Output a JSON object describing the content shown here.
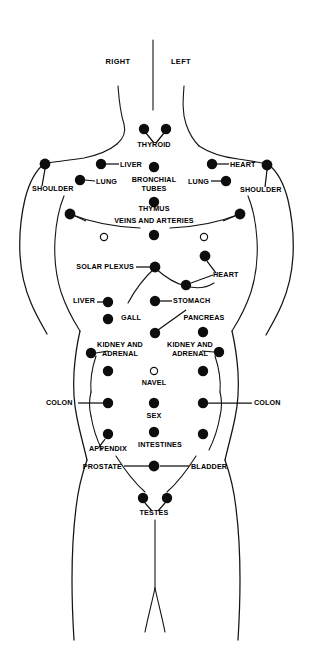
{
  "figure": {
    "title": "",
    "orientation_labels": [
      {
        "id": "right",
        "text": "RIGHT",
        "x": 118,
        "y": 64
      },
      {
        "id": "left",
        "text": "LEFT",
        "x": 181,
        "y": 64
      }
    ],
    "colors": {
      "background": "#ffffff",
      "outline": "#141414",
      "point_fill": "#0d0d0d",
      "open_point_fill": "#ffffff",
      "label_text": "#000000"
    },
    "labels": [
      {
        "id": "thyroid",
        "text": "THYROID",
        "x": 154,
        "y": 147,
        "anchor": "middle"
      },
      {
        "id": "liver-upper",
        "text": "LIVER",
        "x": 120,
        "y": 167,
        "anchor": "start"
      },
      {
        "id": "lung-left",
        "text": "LUNG",
        "x": 96,
        "y": 184,
        "anchor": "start"
      },
      {
        "id": "bronchial-tubes-1",
        "text": "BRONCHIAL",
        "x": 154,
        "y": 182,
        "anchor": "middle"
      },
      {
        "id": "bronchial-tubes-2",
        "text": "TUBES",
        "x": 154,
        "y": 191,
        "anchor": "middle"
      },
      {
        "id": "heart-upper",
        "text": "HEART",
        "x": 230,
        "y": 167,
        "anchor": "start"
      },
      {
        "id": "lung-right",
        "text": "LUNG",
        "x": 209,
        "y": 184,
        "anchor": "end"
      },
      {
        "id": "shoulder-left",
        "text": "SHOULDER",
        "x": 32,
        "y": 191,
        "anchor": "start"
      },
      {
        "id": "shoulder-right",
        "text": "SHOULDER",
        "x": 240,
        "y": 192,
        "anchor": "start"
      },
      {
        "id": "thymus",
        "text": "THYMUS",
        "x": 154,
        "y": 211,
        "anchor": "middle"
      },
      {
        "id": "veins-and-arteries",
        "text": "VEINS AND ARTERIES",
        "x": 154,
        "y": 223,
        "anchor": "middle"
      },
      {
        "id": "solar-plexus",
        "text": "SOLAR PLEXUS",
        "x": 134,
        "y": 269,
        "anchor": "end"
      },
      {
        "id": "heart-lower",
        "text": "HEART",
        "x": 213,
        "y": 277,
        "anchor": "start"
      },
      {
        "id": "liver-lower",
        "text": "LIVER",
        "x": 95,
        "y": 303,
        "anchor": "end"
      },
      {
        "id": "stomach",
        "text": "STOMACH",
        "x": 173,
        "y": 303,
        "anchor": "start"
      },
      {
        "id": "gall",
        "text": "GALL",
        "x": 131,
        "y": 320,
        "anchor": "middle"
      },
      {
        "id": "pancreas",
        "text": "PANCREAS",
        "x": 204,
        "y": 320,
        "anchor": "middle"
      },
      {
        "id": "kidney-adrenal-left-1",
        "text": "KIDNEY AND",
        "x": 120,
        "y": 347,
        "anchor": "middle"
      },
      {
        "id": "kidney-adrenal-left-2",
        "text": "ADRENAL",
        "x": 120,
        "y": 356,
        "anchor": "middle"
      },
      {
        "id": "kidney-adrenal-right-1",
        "text": "KIDNEY AND",
        "x": 190,
        "y": 347,
        "anchor": "middle"
      },
      {
        "id": "kidney-adrenal-right-2",
        "text": "ADRENAL",
        "x": 190,
        "y": 356,
        "anchor": "middle"
      },
      {
        "id": "navel",
        "text": "NAVEL",
        "x": 154,
        "y": 385,
        "anchor": "middle"
      },
      {
        "id": "colon-left",
        "text": "COLON",
        "x": 46,
        "y": 405,
        "anchor": "start"
      },
      {
        "id": "colon-right",
        "text": "COLON",
        "x": 254,
        "y": 405,
        "anchor": "start"
      },
      {
        "id": "sex",
        "text": "SEX",
        "x": 154,
        "y": 418,
        "anchor": "middle"
      },
      {
        "id": "appendix",
        "text": "APPENDIX",
        "x": 108,
        "y": 451,
        "anchor": "middle"
      },
      {
        "id": "intestines",
        "text": "INTESTINES",
        "x": 160,
        "y": 447,
        "anchor": "middle"
      },
      {
        "id": "prostate",
        "text": "PROSTATE",
        "x": 122,
        "y": 469,
        "anchor": "end"
      },
      {
        "id": "bladder",
        "text": "BLADDER",
        "x": 191,
        "y": 469,
        "anchor": "start"
      },
      {
        "id": "testes",
        "text": "TESTES",
        "x": 154,
        "y": 515,
        "anchor": "middle"
      }
    ],
    "points": [
      {
        "id": "thyroid-left",
        "label": "THYROID",
        "x": 144,
        "y": 129,
        "r": 5.2,
        "type": "filled"
      },
      {
        "id": "thyroid-right",
        "label": "THYROID",
        "x": 166,
        "y": 129,
        "r": 5.2,
        "type": "filled"
      },
      {
        "id": "liver-upper",
        "label": "LIVER",
        "x": 101,
        "y": 164,
        "r": 5.2,
        "type": "filled"
      },
      {
        "id": "shoulder-left",
        "label": "SHOULDER",
        "x": 45,
        "y": 164,
        "r": 5.4,
        "type": "filled"
      },
      {
        "id": "lung-left",
        "label": "LUNG",
        "x": 80,
        "y": 180,
        "r": 5.2,
        "type": "filled"
      },
      {
        "id": "bronchial-tubes",
        "label": "BRONCHIAL TUBES",
        "x": 154,
        "y": 167,
        "r": 5.2,
        "type": "filled"
      },
      {
        "id": "heart-upper",
        "label": "HEART",
        "x": 212,
        "y": 164,
        "r": 5.2,
        "type": "filled"
      },
      {
        "id": "shoulder-right",
        "label": "SHOULDER",
        "x": 267,
        "y": 165,
        "r": 5.4,
        "type": "filled"
      },
      {
        "id": "lung-right",
        "label": "LUNG",
        "x": 226,
        "y": 181,
        "r": 5.2,
        "type": "filled"
      },
      {
        "id": "thymus",
        "label": "THYMUS",
        "x": 154,
        "y": 202,
        "r": 5.2,
        "type": "filled"
      },
      {
        "id": "veins-arteries-left",
        "label": "VEINS AND ARTERIES",
        "x": 70,
        "y": 214,
        "r": 5.4,
        "type": "filled"
      },
      {
        "id": "veins-arteries-right",
        "label": "VEINS AND ARTERIES",
        "x": 240,
        "y": 214,
        "r": 5.4,
        "type": "filled"
      },
      {
        "id": "veins-arteries-center",
        "label": "VEINS AND ARTERIES",
        "x": 154,
        "y": 235,
        "r": 5.2,
        "type": "filled"
      },
      {
        "id": "nipple-left",
        "label": "",
        "x": 104,
        "y": 237,
        "r": 3.6,
        "type": "open"
      },
      {
        "id": "nipple-right",
        "label": "",
        "x": 204,
        "y": 237,
        "r": 3.6,
        "type": "open"
      },
      {
        "id": "heart-upper-lower",
        "label": "HEART",
        "x": 205,
        "y": 256,
        "r": 5.4,
        "type": "filled"
      },
      {
        "id": "solar-plexus",
        "label": "SOLAR PLEXUS",
        "x": 155,
        "y": 267,
        "r": 5.4,
        "type": "filled"
      },
      {
        "id": "heart-lower",
        "label": "HEART",
        "x": 186,
        "y": 285,
        "r": 5.2,
        "type": "filled"
      },
      {
        "id": "liver-lower",
        "label": "LIVER",
        "x": 108,
        "y": 302,
        "r": 5.2,
        "type": "filled"
      },
      {
        "id": "stomach",
        "label": "STOMACH",
        "x": 155,
        "y": 301,
        "r": 5.2,
        "type": "filled"
      },
      {
        "id": "gall",
        "label": "GALL",
        "x": 108,
        "y": 319,
        "r": 5.2,
        "type": "filled"
      },
      {
        "id": "pancreas-center",
        "label": "PANCREAS",
        "x": 155,
        "y": 333,
        "r": 5.2,
        "type": "filled"
      },
      {
        "id": "pancreas-right",
        "label": "PANCREAS",
        "x": 203,
        "y": 332,
        "r": 5.2,
        "type": "filled"
      },
      {
        "id": "kidney-adrenal-left",
        "label": "KIDNEY AND ADRENAL",
        "x": 91,
        "y": 353,
        "r": 5.2,
        "type": "filled"
      },
      {
        "id": "kidney-adrenal-right",
        "label": "KIDNEY AND ADRENAL",
        "x": 219,
        "y": 352,
        "r": 5.2,
        "type": "filled"
      },
      {
        "id": "colon-left-1",
        "label": "COLON",
        "x": 108,
        "y": 371,
        "r": 5.2,
        "type": "filled"
      },
      {
        "id": "colon-right-1",
        "label": "COLON",
        "x": 203,
        "y": 371,
        "r": 5.2,
        "type": "filled"
      },
      {
        "id": "navel",
        "label": "NAVEL",
        "x": 154,
        "y": 371,
        "r": 3.6,
        "type": "open"
      },
      {
        "id": "colon-left-2",
        "label": "COLON",
        "x": 108,
        "y": 403,
        "r": 5.2,
        "type": "filled"
      },
      {
        "id": "colon-right-2",
        "label": "COLON",
        "x": 203,
        "y": 403,
        "r": 5.2,
        "type": "filled"
      },
      {
        "id": "sex",
        "label": "SEX",
        "x": 154,
        "y": 403,
        "r": 5.2,
        "type": "filled"
      },
      {
        "id": "appendix",
        "label": "APPENDIX",
        "x": 108,
        "y": 434,
        "r": 5.2,
        "type": "filled"
      },
      {
        "id": "colon-right-3",
        "label": "COLON",
        "x": 203,
        "y": 434,
        "r": 5.2,
        "type": "filled"
      },
      {
        "id": "intestines",
        "label": "INTESTINES",
        "x": 154,
        "y": 432,
        "r": 5.2,
        "type": "filled"
      },
      {
        "id": "prostate-bladder",
        "label": "PROSTATE / BLADDER",
        "x": 154,
        "y": 466,
        "r": 5.4,
        "type": "filled"
      },
      {
        "id": "testes-left",
        "label": "TESTES",
        "x": 143,
        "y": 498,
        "r": 5.2,
        "type": "filled"
      },
      {
        "id": "testes-right",
        "label": "TESTES",
        "x": 167,
        "y": 498,
        "r": 5.2,
        "type": "filled"
      }
    ]
  }
}
